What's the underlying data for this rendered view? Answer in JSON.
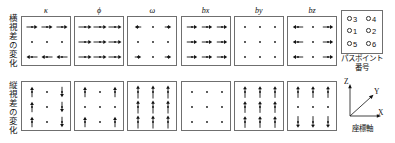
{
  "figure": {
    "row_labels": [
      {
        "id": "horizontal",
        "text": "横視差の変化"
      },
      {
        "id": "vertical",
        "text": "縦視差の変化"
      }
    ],
    "panel_titles": [
      "κ",
      "ϕ",
      "ω",
      "bx",
      "by",
      "bz"
    ],
    "legend": {
      "caption_line1": "パスポイント",
      "caption_line2": "番号",
      "points": [
        "3",
        "4",
        "1",
        "2",
        "5",
        "6"
      ]
    },
    "axes": {
      "caption": "座標軸",
      "labels": {
        "x": "X",
        "y": "Y",
        "z": "Z"
      }
    },
    "colors": {
      "stroke": "#6f6f6f",
      "ink": "#111111",
      "background": "#ffffff"
    }
  },
  "chart_data": {
    "type": "quiver-grid",
    "title": "",
    "rows": [
      "横視差の変化",
      "縦視差の変化"
    ],
    "columns": [
      "κ",
      "ϕ",
      "ω",
      "bx",
      "by",
      "bz"
    ],
    "point_layout": {
      "columns_x": [
        0.2,
        0.5,
        0.8
      ],
      "rows_y": [
        0.2,
        0.5,
        0.8
      ],
      "pass_point_numbers": [
        [
          3,
          null,
          4
        ],
        [
          1,
          null,
          2
        ],
        [
          5,
          null,
          6
        ]
      ]
    },
    "panels": [
      {
        "row": "横視差の変化",
        "param": "κ",
        "vectors": [
          [
            {
              "dx": 1,
              "dy": 0,
              "mag": 0.85
            },
            {
              "dx": 1,
              "dy": 0,
              "mag": 0.85
            },
            {
              "dx": 1,
              "dy": 0,
              "mag": 0.85
            }
          ],
          [
            {
              "dx": 0,
              "dy": 0,
              "mag": 0
            },
            {
              "dx": 0,
              "dy": 0,
              "mag": 0
            },
            {
              "dx": 0,
              "dy": 0,
              "mag": 0
            }
          ],
          [
            {
              "dx": -1,
              "dy": 0,
              "mag": 0.85
            },
            {
              "dx": -1,
              "dy": 0,
              "mag": 0.85
            },
            {
              "dx": -1,
              "dy": 0,
              "mag": 0.85
            }
          ]
        ]
      },
      {
        "row": "横視差の変化",
        "param": "ϕ",
        "vectors": [
          [
            {
              "dx": 1,
              "dy": 0,
              "mag": 1.0
            },
            {
              "dx": 1,
              "dy": 0,
              "mag": 1.0
            },
            {
              "dx": 1,
              "dy": 0,
              "mag": 1.0
            }
          ],
          [
            {
              "dx": 1,
              "dy": 0,
              "mag": 1.0
            },
            {
              "dx": 1,
              "dy": 0,
              "mag": 1.0
            },
            {
              "dx": 1,
              "dy": 0,
              "mag": 1.0
            }
          ],
          [
            {
              "dx": 1,
              "dy": 0,
              "mag": 1.0
            },
            {
              "dx": 1,
              "dy": 0,
              "mag": 1.0
            },
            {
              "dx": 1,
              "dy": 0,
              "mag": 1.0
            }
          ]
        ]
      },
      {
        "row": "横視差の変化",
        "param": "ω",
        "vectors": [
          [
            {
              "dx": -1,
              "dy": 0,
              "mag": 0.5
            },
            {
              "dx": 0,
              "dy": 0,
              "mag": 0
            },
            {
              "dx": 1,
              "dy": 0,
              "mag": 0.5
            }
          ],
          [
            {
              "dx": 0,
              "dy": 0,
              "mag": 0
            },
            {
              "dx": 0,
              "dy": 0,
              "mag": 0
            },
            {
              "dx": 0,
              "dy": 0,
              "mag": 0
            }
          ],
          [
            {
              "dx": 1,
              "dy": 0,
              "mag": 0.5
            },
            {
              "dx": 0,
              "dy": 0,
              "mag": 0
            },
            {
              "dx": 1,
              "dy": 0,
              "mag": 0.5
            }
          ]
        ]
      },
      {
        "row": "横視差の変化",
        "param": "bx",
        "vectors": [
          [
            {
              "dx": 1,
              "dy": 0,
              "mag": 0.8
            },
            {
              "dx": 1,
              "dy": 0,
              "mag": 0.8
            },
            {
              "dx": 1,
              "dy": 0,
              "mag": 0.8
            }
          ],
          [
            {
              "dx": 1,
              "dy": 0,
              "mag": 0.8
            },
            {
              "dx": 1,
              "dy": 0,
              "mag": 0.8
            },
            {
              "dx": 1,
              "dy": 0,
              "mag": 0.8
            }
          ],
          [
            {
              "dx": 1,
              "dy": 0,
              "mag": 0.8
            },
            {
              "dx": 1,
              "dy": 0,
              "mag": 0.8
            },
            {
              "dx": 1,
              "dy": 0,
              "mag": 0.8
            }
          ]
        ]
      },
      {
        "row": "横視差の変化",
        "param": "by",
        "vectors": [
          [
            {
              "dx": 0,
              "dy": 0,
              "mag": 0
            },
            {
              "dx": 0,
              "dy": 0,
              "mag": 0
            },
            {
              "dx": 0,
              "dy": 0,
              "mag": 0
            }
          ],
          [
            {
              "dx": 0,
              "dy": 0,
              "mag": 0
            },
            {
              "dx": 0,
              "dy": 0,
              "mag": 0
            },
            {
              "dx": 0,
              "dy": 0,
              "mag": 0
            }
          ],
          [
            {
              "dx": 0,
              "dy": 0,
              "mag": 0
            },
            {
              "dx": 0,
              "dy": 0,
              "mag": 0
            },
            {
              "dx": 0,
              "dy": 0,
              "mag": 0
            }
          ]
        ]
      },
      {
        "row": "横視差の変化",
        "param": "bz",
        "vectors": [
          [
            {
              "dx": -1,
              "dy": 0,
              "mag": 0.8
            },
            {
              "dx": 0,
              "dy": 0,
              "mag": 0
            },
            {
              "dx": 1,
              "dy": 0,
              "mag": 0.8
            }
          ],
          [
            {
              "dx": -1,
              "dy": 0,
              "mag": 0.8
            },
            {
              "dx": 0,
              "dy": 0,
              "mag": 0
            },
            {
              "dx": 1,
              "dy": 0,
              "mag": 0.8
            }
          ],
          [
            {
              "dx": -1,
              "dy": 0,
              "mag": 0.8
            },
            {
              "dx": 0,
              "dy": 0,
              "mag": 0
            },
            {
              "dx": 1,
              "dy": 0,
              "mag": 0.8
            }
          ]
        ]
      },
      {
        "row": "縦視差の変化",
        "param": "κ",
        "vectors": [
          [
            {
              "dx": 0,
              "dy": -1,
              "mag": 0.8
            },
            {
              "dx": 0,
              "dy": 0,
              "mag": 0
            },
            {
              "dx": 0,
              "dy": 1,
              "mag": 0.8
            }
          ],
          [
            {
              "dx": 0,
              "dy": -1,
              "mag": 0.8
            },
            {
              "dx": 0,
              "dy": 0,
              "mag": 0
            },
            {
              "dx": 0,
              "dy": 1,
              "mag": 0.8
            }
          ],
          [
            {
              "dx": 0,
              "dy": -1,
              "mag": 0.8
            },
            {
              "dx": 0,
              "dy": 0,
              "mag": 0
            },
            {
              "dx": 0,
              "dy": 1,
              "mag": 0.8
            }
          ]
        ]
      },
      {
        "row": "縦視差の変化",
        "param": "ϕ",
        "vectors": [
          [
            {
              "dx": 0,
              "dy": -1,
              "mag": 0.8
            },
            {
              "dx": 0,
              "dy": 0,
              "mag": 0
            },
            {
              "dx": 0,
              "dy": -1,
              "mag": 0.8
            }
          ],
          [
            {
              "dx": 0,
              "dy": 0,
              "mag": 0
            },
            {
              "dx": 0,
              "dy": 0,
              "mag": 0
            },
            {
              "dx": 0,
              "dy": 0,
              "mag": 0
            }
          ],
          [
            {
              "dx": 0,
              "dy": -1,
              "mag": 0.8
            },
            {
              "dx": 0,
              "dy": 0,
              "mag": 0
            },
            {
              "dx": 0,
              "dy": -1,
              "mag": 0.8
            }
          ]
        ]
      },
      {
        "row": "縦視差の変化",
        "param": "ω",
        "vectors": [
          [
            {
              "dx": 0,
              "dy": -1,
              "mag": 1.0
            },
            {
              "dx": 0,
              "dy": -1,
              "mag": 1.0
            },
            {
              "dx": 0,
              "dy": -1,
              "mag": 1.0
            }
          ],
          [
            {
              "dx": 0,
              "dy": -1,
              "mag": 1.0
            },
            {
              "dx": 0,
              "dy": -1,
              "mag": 1.0
            },
            {
              "dx": 0,
              "dy": -1,
              "mag": 1.0
            }
          ],
          [
            {
              "dx": 0,
              "dy": -1,
              "mag": 1.0
            },
            {
              "dx": 0,
              "dy": -1,
              "mag": 1.0
            },
            {
              "dx": 0,
              "dy": -1,
              "mag": 1.0
            }
          ]
        ]
      },
      {
        "row": "縦視差の変化",
        "param": "bx",
        "vectors": [
          [
            {
              "dx": 0,
              "dy": 0,
              "mag": 0
            },
            {
              "dx": 0,
              "dy": 0,
              "mag": 0
            },
            {
              "dx": 0,
              "dy": 0,
              "mag": 0
            }
          ],
          [
            {
              "dx": 0,
              "dy": 0,
              "mag": 0
            },
            {
              "dx": 0,
              "dy": 0,
              "mag": 0
            },
            {
              "dx": 0,
              "dy": 0,
              "mag": 0
            }
          ],
          [
            {
              "dx": 0,
              "dy": 0,
              "mag": 0
            },
            {
              "dx": 0,
              "dy": 0,
              "mag": 0
            },
            {
              "dx": 0,
              "dy": 0,
              "mag": 0
            }
          ]
        ]
      },
      {
        "row": "縦視差の変化",
        "param": "by",
        "vectors": [
          [
            {
              "dx": 0,
              "dy": -1,
              "mag": 0.9
            },
            {
              "dx": 0,
              "dy": -1,
              "mag": 0.9
            },
            {
              "dx": 0,
              "dy": -1,
              "mag": 0.9
            }
          ],
          [
            {
              "dx": 0,
              "dy": -1,
              "mag": 0.9
            },
            {
              "dx": 0,
              "dy": -1,
              "mag": 0.9
            },
            {
              "dx": 0,
              "dy": -1,
              "mag": 0.9
            }
          ],
          [
            {
              "dx": 0,
              "dy": -1,
              "mag": 0.9
            },
            {
              "dx": 0,
              "dy": -1,
              "mag": 0.9
            },
            {
              "dx": 0,
              "dy": -1,
              "mag": 0.9
            }
          ]
        ]
      },
      {
        "row": "縦視差の変化",
        "param": "bz",
        "vectors": [
          [
            {
              "dx": 0,
              "dy": -1,
              "mag": 0.9
            },
            {
              "dx": 0,
              "dy": -1,
              "mag": 0.9
            },
            {
              "dx": 0,
              "dy": -1,
              "mag": 0.9
            }
          ],
          [
            {
              "dx": 0,
              "dy": 0,
              "mag": 0
            },
            {
              "dx": 0,
              "dy": 0,
              "mag": 0
            },
            {
              "dx": 0,
              "dy": 0,
              "mag": 0
            }
          ],
          [
            {
              "dx": 0,
              "dy": 1,
              "mag": 0.9
            },
            {
              "dx": 0,
              "dy": 1,
              "mag": 0.9
            },
            {
              "dx": 0,
              "dy": 1,
              "mag": 0.9
            }
          ]
        ]
      }
    ]
  }
}
